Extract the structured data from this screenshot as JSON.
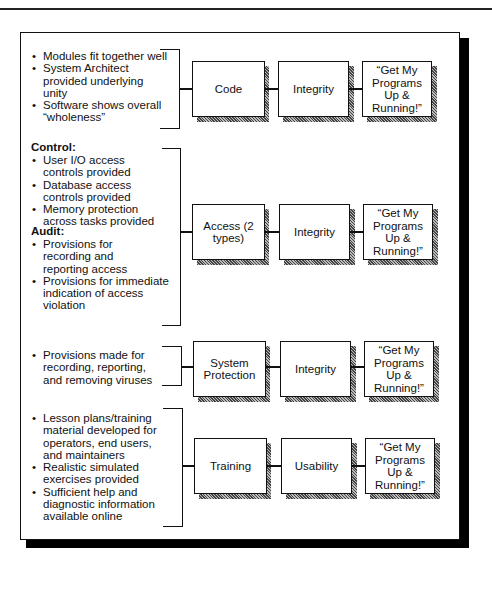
{
  "diagram": {
    "rows": [
      {
        "id": "code",
        "headings": [],
        "bullets": [
          "Modules fit together well",
          "System Architect provided underlying unity",
          "Software shows overall “wholeness”"
        ],
        "box1": "Code",
        "box2": "Integrity",
        "box3": "“Get My Programs Up & Running!”"
      },
      {
        "id": "access",
        "groups": [
          {
            "heading": "Control:",
            "bullets": [
              "User I/O access controls provided",
              "Database access controls provided",
              "Memory protection across tasks provided"
            ]
          },
          {
            "heading": "Audit:",
            "bullets": [
              "Provisions for recording and reporting access",
              "Provisions for immediate indication of access violation"
            ]
          }
        ],
        "box1": "Access (2 types)",
        "box2": "Integrity",
        "box3": "“Get My Programs Up & Running!”"
      },
      {
        "id": "system-protection",
        "bullets": [
          "Provisions made for recording, reporting, and removing viruses"
        ],
        "box1": "System Protection",
        "box2": "Integrity",
        "box3": "“Get My Programs Up & Running!”"
      },
      {
        "id": "training",
        "bullets": [
          "Lesson plans/training material developed for operators, end users, and maintainers",
          "Realistic simulated exercises provided",
          "Sufficient help and diagnostic information available online"
        ],
        "box1": "Training",
        "box2": "Usability",
        "box3": "“Get My Programs Up & Running!”"
      }
    ],
    "colors": {
      "ink": "#111111",
      "background": "#ffffff",
      "shadow": "#777777"
    }
  }
}
